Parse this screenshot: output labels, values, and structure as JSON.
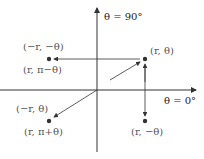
{
  "axes": {
    "vertical_label": "θ = 90°",
    "horizontal_label": "θ = 0°"
  },
  "points": [
    {
      "name": "original",
      "label": "(r, θ)"
    },
    {
      "name": "upper-left",
      "label_top": "(−r, −θ)",
      "label_bottom": "(r, π−θ)"
    },
    {
      "name": "lower-left",
      "label_top": "(−r, θ)",
      "label_bottom": "(r, π+θ)"
    },
    {
      "name": "lower-right",
      "label": "(r, −θ)"
    }
  ],
  "colors": {
    "axis": "#333333",
    "point": "#333333",
    "text": "#555555"
  }
}
